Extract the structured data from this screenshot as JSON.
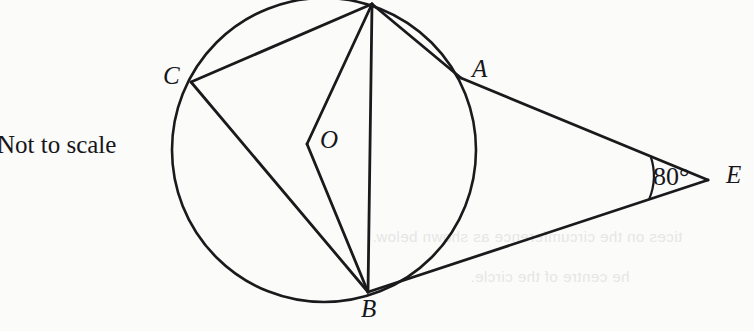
{
  "figure": {
    "kind": "circle-geometry-diagram",
    "note_label": "Not to scale",
    "angle_label": "80°",
    "stroke_color": "#1a1a1d",
    "background_color": "#fbfbfa",
    "circle": {
      "cx": 324,
      "cy": 150,
      "r": 152
    },
    "points": [
      {
        "name": "D",
        "label": "",
        "x": 372,
        "y": 4,
        "on_circle": true,
        "label_shown": false
      },
      {
        "name": "C",
        "label": "C",
        "x": 191,
        "y": 82,
        "on_circle": true,
        "label_shown": true
      },
      {
        "name": "A",
        "label": "A",
        "x": 461,
        "y": 78,
        "on_circle": true,
        "label_shown": true
      },
      {
        "name": "O",
        "label": "O",
        "x": 307,
        "y": 144,
        "on_circle": false,
        "label_shown": true
      },
      {
        "name": "B",
        "label": "B",
        "x": 368,
        "y": 292,
        "on_circle": true,
        "label_shown": true
      },
      {
        "name": "E",
        "label": "E",
        "x": 708,
        "y": 180,
        "on_circle": false,
        "label_shown": true
      }
    ],
    "segments": [
      {
        "from": "D",
        "to": "C"
      },
      {
        "from": "D",
        "to": "O"
      },
      {
        "from": "O",
        "to": "B"
      },
      {
        "from": "D",
        "to": "A"
      },
      {
        "from": "A",
        "to": "E"
      },
      {
        "from": "D",
        "to": "B"
      },
      {
        "from": "C",
        "to": "B"
      },
      {
        "from": "B",
        "to": "E"
      }
    ],
    "angle_arc": {
      "vertex": "E",
      "value": "80°",
      "radius": 62
    }
  },
  "ghost_text": {
    "line_1": "tices on the circumference as shown below.",
    "line_2": "he centre of the circle.",
    "line_3": ""
  }
}
